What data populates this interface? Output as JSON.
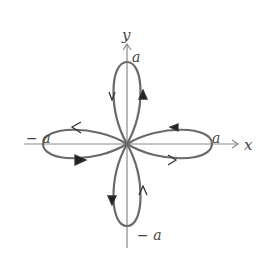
{
  "diagram": {
    "type": "four-leaved rose curve with orientation arrows",
    "axes": {
      "x_label": "x",
      "y_label": "y"
    },
    "tick_labels": {
      "top": "a",
      "right": "a",
      "bottom": "− a",
      "left": "− a"
    },
    "petals": [
      {
        "name": "top",
        "arrows": [
          "left side pointing down",
          "right side pointing up (filled)"
        ]
      },
      {
        "name": "right",
        "arrows": [
          "top side pointing left (filled)",
          "bottom side pointing right"
        ]
      },
      {
        "name": "bottom",
        "arrows": [
          "left side pointing down (filled)",
          "right side pointing up"
        ]
      },
      {
        "name": "left",
        "arrows": [
          "top side pointing left",
          "bottom side pointing right (filled)"
        ]
      }
    ],
    "colors": {
      "curve": "#6a6a6a",
      "axes": "#8a8a8a",
      "labels": "#444444",
      "background": "#ffffff"
    }
  }
}
